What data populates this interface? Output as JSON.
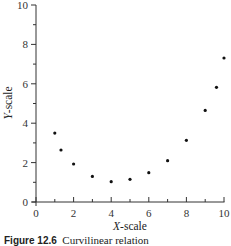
{
  "chart_data": {
    "type": "scatter",
    "title": "",
    "xlabel_italic": "X",
    "xlabel_rest": "-scale",
    "ylabel_italic": "Y",
    "ylabel_rest": "-scale",
    "xlabel": "X-scale",
    "ylabel": "Y-scale",
    "xlim": [
      0,
      10
    ],
    "ylim": [
      0,
      10
    ],
    "x_major_ticks": [
      0,
      2,
      4,
      6,
      8,
      10
    ],
    "x_minor_ticks": [
      1,
      3,
      5,
      7,
      9
    ],
    "y_major_ticks": [
      0,
      2,
      4,
      6,
      8,
      10
    ],
    "y_minor_ticks": [
      1,
      3,
      5,
      7,
      9
    ],
    "grid": false,
    "legend": null,
    "series": [
      {
        "name": "observations",
        "x": [
          1.0,
          1.33,
          2.0,
          3.0,
          4.0,
          5.0,
          6.0,
          7.0,
          8.0,
          9.0,
          9.6,
          10.0
        ],
        "y": [
          3.5,
          2.64,
          1.93,
          1.3,
          1.03,
          1.15,
          1.49,
          2.1,
          3.13,
          4.65,
          5.82,
          7.31
        ]
      }
    ]
  },
  "caption": {
    "label": "Figure 12.6",
    "text": "Curvilinear relation"
  }
}
